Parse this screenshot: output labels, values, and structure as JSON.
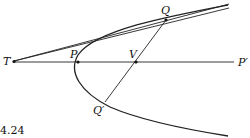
{
  "figure": {
    "caption": "4.24",
    "labels": {
      "T": "T",
      "P": "P",
      "V": "V",
      "P_prime": "P′",
      "Q": "Q",
      "Q_prime": "Q′"
    },
    "colors": {
      "stroke": "#222222",
      "background": "#ffffff"
    }
  }
}
